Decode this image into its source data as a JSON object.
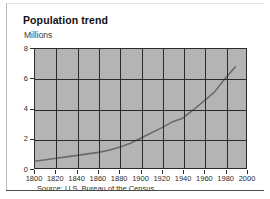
{
  "card": {
    "title": "Population trend",
    "source_note": "Source: U.S. Bureau of the Census"
  },
  "chart_data": {
    "type": "line",
    "title": "Population trend",
    "xlabel": "",
    "ylabel": "Millions",
    "xlim": [
      1800,
      2000
    ],
    "ylim": [
      0,
      8
    ],
    "xticks": [
      1800,
      1820,
      1840,
      1860,
      1880,
      1900,
      1920,
      1940,
      1960,
      1980,
      2000
    ],
    "yticks": [
      0,
      2,
      4,
      6,
      8
    ],
    "grid": true,
    "legend": "none",
    "plot_background": "#b4b4b4",
    "line_color": "#6b6b6b",
    "axis_color": "#2b2b2b",
    "x": [
      1800,
      1810,
      1820,
      1830,
      1840,
      1850,
      1860,
      1870,
      1880,
      1890,
      1900,
      1910,
      1920,
      1930,
      1940,
      1950,
      1960,
      1970,
      1980,
      1990
    ],
    "values": [
      0.45,
      0.55,
      0.65,
      0.75,
      0.85,
      0.95,
      1.05,
      1.2,
      1.4,
      1.65,
      2.0,
      2.35,
      2.7,
      3.1,
      3.35,
      3.9,
      4.5,
      5.1,
      6.0,
      6.8
    ],
    "series": [
      {
        "name": "Population",
        "values": [
          0.45,
          0.55,
          0.65,
          0.75,
          0.85,
          0.95,
          1.05,
          1.2,
          1.4,
          1.65,
          2.0,
          2.35,
          2.7,
          3.1,
          3.35,
          3.9,
          4.5,
          5.1,
          6.0,
          6.8
        ]
      }
    ]
  }
}
